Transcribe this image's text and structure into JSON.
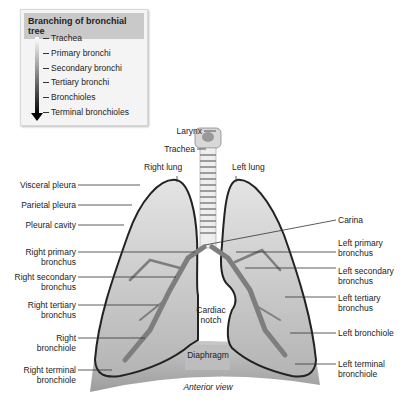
{
  "legend": {
    "title": "Branching of bronchial tree",
    "items": [
      "Trachea",
      "Primary bronchi",
      "Secondary bronchi",
      "Tertiary bronchi",
      "Bronchioles",
      "Terminal bronchioles"
    ]
  },
  "labels": {
    "larynx": "Larynx",
    "trachea": "Trachea",
    "right_lung": "Right lung",
    "left_lung": "Left lung",
    "visceral_pleura": "Visceral pleura",
    "parietal_pleura": "Parietal pleura",
    "pleural_cavity": "Pleural cavity",
    "right_primary": [
      "Right primary",
      "bronchus"
    ],
    "right_secondary": [
      "Right secondary",
      "bronchus"
    ],
    "right_tertiary": [
      "Right tertiary",
      "bronchus"
    ],
    "right_bronchiole": [
      "Right",
      "bronchiole"
    ],
    "right_terminal": [
      "Right terminal",
      "bronchiole"
    ],
    "carina": "Carina",
    "left_primary": [
      "Left primary",
      "bronchus"
    ],
    "left_secondary": [
      "Left secondary",
      "bronchus"
    ],
    "left_tertiary": [
      "Left tertiary",
      "bronchus"
    ],
    "left_bronchiole": "Left bronchiole",
    "left_terminal": [
      "Left terminal",
      "bronchiole"
    ],
    "cardiac_notch": [
      "Cardiac",
      "notch"
    ],
    "diaphragm": "Diaphragm",
    "view": "Anterior view"
  }
}
